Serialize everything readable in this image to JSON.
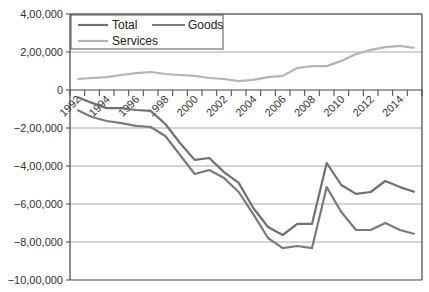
{
  "chart_data": {
    "type": "line",
    "title": "",
    "xlabel": "",
    "ylabel": "",
    "ylim": [
      -1000000,
      400000
    ],
    "y_ticks": [
      400000,
      200000,
      0,
      -200000,
      -400000,
      -600000,
      -800000,
      -1000000
    ],
    "y_tick_labels": [
      "4,00,000",
      "2,00,000",
      "0",
      "−2,00,000",
      "−4,00,000",
      "−6,00,000",
      "−8,00,000",
      "−10,00,000"
    ],
    "x": [
      1992,
      1993,
      1994,
      1995,
      1996,
      1997,
      1998,
      1999,
      2000,
      2001,
      2002,
      2003,
      2004,
      2005,
      2006,
      2007,
      2008,
      2009,
      2010,
      2011,
      2012,
      2013,
      2014,
      2015
    ],
    "x_tick_labels": [
      "1992",
      "1994",
      "1996",
      "1998",
      "2000",
      "2002",
      "2004",
      "2006",
      "2008",
      "2010",
      "2012",
      "2014"
    ],
    "grid": true,
    "legend_position": "top-left inside",
    "series": [
      {
        "name": "Total",
        "color": "#707070",
        "values": [
          -37000,
          -68000,
          -95000,
          -95000,
          -105000,
          -110000,
          -179000,
          -279000,
          -368000,
          -358000,
          -432000,
          -489000,
          -621000,
          -721000,
          -763000,
          -705000,
          -705000,
          -384000,
          -500000,
          -547000,
          -537000,
          -479000,
          -511000,
          -537000
        ]
      },
      {
        "name": "Goods",
        "color": "#7a7a7a",
        "values": [
          -105000,
          -142000,
          -163000,
          -174000,
          -189000,
          -195000,
          -242000,
          -342000,
          -442000,
          -421000,
          -463000,
          -537000,
          -653000,
          -779000,
          -832000,
          -821000,
          -832000,
          -511000,
          -642000,
          -737000,
          -737000,
          -700000,
          -737000,
          -758000
        ]
      },
      {
        "name": "Services",
        "color": "#b4b4b4",
        "values": [
          58000,
          63000,
          68000,
          79000,
          89000,
          95000,
          84000,
          79000,
          74000,
          63000,
          58000,
          47000,
          53000,
          68000,
          74000,
          116000,
          126000,
          126000,
          153000,
          189000,
          211000,
          226000,
          232000,
          221000
        ]
      }
    ]
  },
  "legend": {
    "items": [
      {
        "label": "Total",
        "color": "#707070"
      },
      {
        "label": "Goods",
        "color": "#7a7a7a"
      },
      {
        "label": "Services",
        "color": "#b4b4b4"
      }
    ]
  }
}
